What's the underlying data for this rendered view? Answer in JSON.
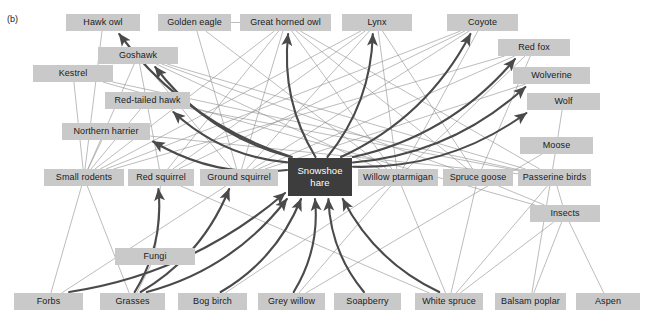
{
  "figure": {
    "panel_label": "(b)",
    "width": 645,
    "height": 321,
    "background": "#ffffff",
    "node_fill": "#c9c9c9",
    "node_text": "#1a1a1a",
    "focal_fill": "#3d3d3d",
    "focal_text": "#ffffff",
    "thin_link_color": "#8f8f8f",
    "thick_link_color": "#4a4a4a"
  },
  "nodes": [
    {
      "id": "hawk_owl",
      "label": "Hawk owl",
      "x": 66,
      "y": 14,
      "w": 74,
      "h": 17,
      "focal": false
    },
    {
      "id": "golden_eagle",
      "label": "Golden eagle",
      "x": 158,
      "y": 14,
      "w": 73,
      "h": 17,
      "focal": false
    },
    {
      "id": "great_horned_owl",
      "label": "Great horned owl",
      "x": 240,
      "y": 14,
      "w": 91,
      "h": 17,
      "focal": false
    },
    {
      "id": "lynx",
      "label": "Lynx",
      "x": 342,
      "y": 14,
      "w": 70,
      "h": 17,
      "focal": false
    },
    {
      "id": "coyote",
      "label": "Coyote",
      "x": 447,
      "y": 14,
      "w": 71,
      "h": 17,
      "focal": false
    },
    {
      "id": "goshawk",
      "label": "Goshawk",
      "x": 98,
      "y": 47,
      "w": 80,
      "h": 17,
      "focal": false
    },
    {
      "id": "red_fox",
      "label": "Red fox",
      "x": 498,
      "y": 39,
      "w": 72,
      "h": 17,
      "focal": false
    },
    {
      "id": "kestrel",
      "label": "Kestrel",
      "x": 33,
      "y": 65,
      "w": 80,
      "h": 17,
      "focal": false
    },
    {
      "id": "wolverine",
      "label": "Wolverine",
      "x": 513,
      "y": 67,
      "w": 77,
      "h": 17,
      "focal": false
    },
    {
      "id": "red_tailed_hawk",
      "label": "Red-tailed hawk",
      "x": 105,
      "y": 92,
      "w": 85,
      "h": 17,
      "focal": false
    },
    {
      "id": "wolf",
      "label": "Wolf",
      "x": 527,
      "y": 93,
      "w": 73,
      "h": 17,
      "focal": false
    },
    {
      "id": "northern_harrier",
      "label": "Northern harrier",
      "x": 62,
      "y": 123,
      "w": 88,
      "h": 17,
      "focal": false
    },
    {
      "id": "moose",
      "label": "Moose",
      "x": 520,
      "y": 137,
      "w": 73,
      "h": 17,
      "focal": false
    },
    {
      "id": "small_rodents",
      "label": "Small rodents",
      "x": 44,
      "y": 169,
      "w": 80,
      "h": 17,
      "focal": false
    },
    {
      "id": "red_squirrel",
      "label": "Red squirrel",
      "x": 128,
      "y": 169,
      "w": 66,
      "h": 17,
      "focal": false
    },
    {
      "id": "ground_squirrel",
      "label": "Ground squirrel",
      "x": 200,
      "y": 169,
      "w": 78,
      "h": 17,
      "focal": false
    },
    {
      "id": "snowshoe_hare",
      "label": "Snowshoe hare",
      "x": 288,
      "y": 158,
      "w": 64,
      "h": 38,
      "focal": true
    },
    {
      "id": "willow_ptarmigan",
      "label": "Willow ptarmigan",
      "x": 358,
      "y": 169,
      "w": 80,
      "h": 17,
      "focal": false
    },
    {
      "id": "spruce_goose",
      "label": "Spruce goose",
      "x": 443,
      "y": 169,
      "w": 70,
      "h": 17,
      "focal": false
    },
    {
      "id": "passerine_birds",
      "label": "Passerine birds",
      "x": 518,
      "y": 169,
      "w": 73,
      "h": 17,
      "focal": false
    },
    {
      "id": "insects",
      "label": "Insects",
      "x": 530,
      "y": 205,
      "w": 70,
      "h": 17,
      "focal": false
    },
    {
      "id": "fungi",
      "label": "Fungi",
      "x": 115,
      "y": 248,
      "w": 80,
      "h": 17,
      "focal": false
    },
    {
      "id": "forbs",
      "label": "Forbs",
      "x": 14,
      "y": 293,
      "w": 69,
      "h": 17,
      "focal": false
    },
    {
      "id": "grasses",
      "label": "Grasses",
      "x": 100,
      "y": 293,
      "w": 65,
      "h": 17,
      "focal": false
    },
    {
      "id": "bog_birch",
      "label": "Bog birch",
      "x": 178,
      "y": 293,
      "w": 69,
      "h": 17,
      "focal": false
    },
    {
      "id": "grey_willow",
      "label": "Grey willow",
      "x": 258,
      "y": 293,
      "w": 67,
      "h": 17,
      "focal": false
    },
    {
      "id": "soapberry",
      "label": "Soapberry",
      "x": 334,
      "y": 293,
      "w": 67,
      "h": 17,
      "focal": false
    },
    {
      "id": "white_spruce",
      "label": "White spruce",
      "x": 415,
      "y": 293,
      "w": 68,
      "h": 17,
      "focal": false
    },
    {
      "id": "balsam_poplar",
      "label": "Balsam poplar",
      "x": 495,
      "y": 293,
      "w": 71,
      "h": 17,
      "focal": false
    },
    {
      "id": "aspen",
      "label": "Aspen",
      "x": 576,
      "y": 293,
      "w": 64,
      "h": 17,
      "focal": false
    }
  ],
  "chart_data": {
    "type": "diagram",
    "focal_species": "Snowshoe hare",
    "thick_links": [
      {
        "from": "grasses",
        "to": "snowshoe_hare"
      },
      {
        "from": "forbs",
        "to": "snowshoe_hare"
      },
      {
        "from": "bog_birch",
        "to": "snowshoe_hare"
      },
      {
        "from": "grey_willow",
        "to": "snowshoe_hare"
      },
      {
        "from": "soapberry",
        "to": "snowshoe_hare"
      },
      {
        "from": "white_spruce",
        "to": "snowshoe_hare"
      },
      {
        "from": "snowshoe_hare",
        "to": "hawk_owl"
      },
      {
        "from": "snowshoe_hare",
        "to": "goshawk"
      },
      {
        "from": "snowshoe_hare",
        "to": "red_tailed_hawk"
      },
      {
        "from": "snowshoe_hare",
        "to": "northern_harrier"
      },
      {
        "from": "snowshoe_hare",
        "to": "great_horned_owl"
      },
      {
        "from": "snowshoe_hare",
        "to": "lynx"
      },
      {
        "from": "snowshoe_hare",
        "to": "coyote"
      },
      {
        "from": "snowshoe_hare",
        "to": "red_fox"
      },
      {
        "from": "snowshoe_hare",
        "to": "wolverine"
      },
      {
        "from": "snowshoe_hare",
        "to": "wolf"
      },
      {
        "from": "grasses",
        "to": "red_squirrel"
      },
      {
        "from": "grasses",
        "to": "ground_squirrel"
      }
    ],
    "thin_links": [
      {
        "from": "forbs",
        "to": "small_rodents"
      },
      {
        "from": "grasses",
        "to": "small_rodents"
      },
      {
        "from": "forbs",
        "to": "ground_squirrel"
      },
      {
        "from": "grasses",
        "to": "fungi"
      },
      {
        "from": "fungi",
        "to": "red_squirrel"
      },
      {
        "from": "white_spruce",
        "to": "red_squirrel"
      },
      {
        "from": "white_spruce",
        "to": "spruce_goose"
      },
      {
        "from": "white_spruce",
        "to": "passerine_birds"
      },
      {
        "from": "white_spruce",
        "to": "insects"
      },
      {
        "from": "white_spruce",
        "to": "willow_ptarmigan"
      },
      {
        "from": "balsam_poplar",
        "to": "insects"
      },
      {
        "from": "aspen",
        "to": "insects"
      },
      {
        "from": "insects",
        "to": "passerine_birds"
      },
      {
        "from": "insects",
        "to": "spruce_goose"
      },
      {
        "from": "bog_birch",
        "to": "willow_ptarmigan"
      },
      {
        "from": "grey_willow",
        "to": "willow_ptarmigan"
      },
      {
        "from": "grey_willow",
        "to": "moose"
      },
      {
        "from": "balsam_poplar",
        "to": "moose"
      },
      {
        "from": "moose",
        "to": "wolf"
      },
      {
        "from": "small_rodents",
        "to": "kestrel"
      },
      {
        "from": "small_rodents",
        "to": "hawk_owl"
      },
      {
        "from": "small_rodents",
        "to": "northern_harrier"
      },
      {
        "from": "small_rodents",
        "to": "great_horned_owl"
      },
      {
        "from": "small_rodents",
        "to": "goshawk"
      },
      {
        "from": "small_rodents",
        "to": "red_tailed_hawk"
      },
      {
        "from": "small_rodents",
        "to": "lynx"
      },
      {
        "from": "small_rodents",
        "to": "coyote"
      },
      {
        "from": "small_rodents",
        "to": "red_fox"
      },
      {
        "from": "red_squirrel",
        "to": "goshawk"
      },
      {
        "from": "red_squirrel",
        "to": "great_horned_owl"
      },
      {
        "from": "red_squirrel",
        "to": "lynx"
      },
      {
        "from": "red_squirrel",
        "to": "coyote"
      },
      {
        "from": "ground_squirrel",
        "to": "golden_eagle"
      },
      {
        "from": "ground_squirrel",
        "to": "great_horned_owl"
      },
      {
        "from": "ground_squirrel",
        "to": "goshawk"
      },
      {
        "from": "ground_squirrel",
        "to": "lynx"
      },
      {
        "from": "ground_squirrel",
        "to": "coyote"
      },
      {
        "from": "ground_squirrel",
        "to": "red_fox"
      },
      {
        "from": "ground_squirrel",
        "to": "wolverine"
      },
      {
        "from": "willow_ptarmigan",
        "to": "goshawk"
      },
      {
        "from": "willow_ptarmigan",
        "to": "great_horned_owl"
      },
      {
        "from": "willow_ptarmigan",
        "to": "golden_eagle"
      },
      {
        "from": "willow_ptarmigan",
        "to": "lynx"
      },
      {
        "from": "willow_ptarmigan",
        "to": "coyote"
      },
      {
        "from": "willow_ptarmigan",
        "to": "red_fox"
      },
      {
        "from": "spruce_goose",
        "to": "goshawk"
      },
      {
        "from": "spruce_goose",
        "to": "great_horned_owl"
      },
      {
        "from": "spruce_goose",
        "to": "red_fox"
      },
      {
        "from": "spruce_goose",
        "to": "lynx"
      },
      {
        "from": "passerine_birds",
        "to": "goshawk"
      },
      {
        "from": "passerine_birds",
        "to": "kestrel"
      },
      {
        "from": "passerine_birds",
        "to": "red_tailed_hawk"
      },
      {
        "from": "passerine_birds",
        "to": "northern_harrier"
      },
      {
        "from": "passerine_birds",
        "to": "great_horned_owl"
      },
      {
        "from": "insects",
        "to": "kestrel"
      },
      {
        "from": "golden_eagle",
        "to": "great_horned_owl"
      }
    ]
  }
}
